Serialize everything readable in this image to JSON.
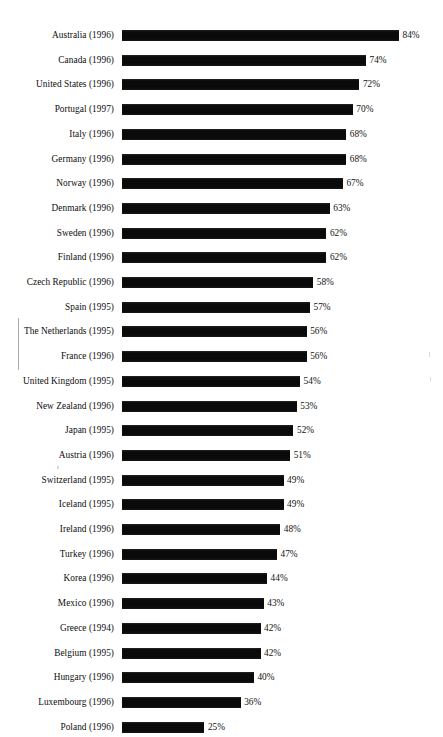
{
  "chart_data": {
    "type": "bar",
    "orientation": "horizontal",
    "title": "",
    "subtitle": "",
    "xlabel": "",
    "ylabel": "",
    "grid": false,
    "legend": false,
    "legend_position": "none",
    "value_suffix": "%",
    "xlim": [
      0,
      84
    ],
    "bar_color": "#000000",
    "background_color": "#ffffff",
    "categories": [
      "Australia (1996)",
      "Canada (1996)",
      "United States (1996)",
      "Portugal (1997)",
      "Italy (1996)",
      "Germany (1996)",
      "Norway (1996)",
      "Denmark (1996)",
      "Sweden (1996)",
      "Finland (1996)",
      "Czech Republic (1996)",
      "Spain (1995)",
      "The Netherlands (1995)",
      "France (1996)",
      "United Kingdom (1995)",
      "New Zealand (1996)",
      "Japan (1995)",
      "Austria (1996)",
      "Switzerland (1995)",
      "Iceland (1995)",
      "Ireland (1996)",
      "Turkey (1996)",
      "Korea (1996)",
      "Mexico (1996)",
      "Greece (1994)",
      "Belgium (1995)",
      "Hungary (1996)",
      "Luxembourg (1996)",
      "Poland (1996)"
    ],
    "values": [
      84,
      74,
      72,
      70,
      68,
      68,
      67,
      63,
      62,
      62,
      58,
      57,
      56,
      56,
      54,
      53,
      52,
      51,
      49,
      49,
      48,
      47,
      44,
      43,
      42,
      42,
      40,
      36,
      25
    ],
    "value_labels": [
      "84%",
      "74%",
      "72%",
      "70%",
      "68%",
      "68%",
      "67%",
      "63%",
      "62%",
      "62%",
      "58%",
      "57%",
      "56%",
      "56%",
      "54%",
      "53%",
      "52%",
      "51%",
      "49%",
      "49%",
      "48%",
      "47%",
      "44%",
      "43%",
      "42%",
      "42%",
      "40%",
      "36%",
      "25%"
    ]
  }
}
